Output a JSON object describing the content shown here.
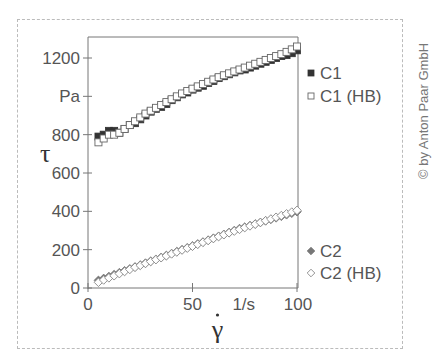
{
  "chart_data": {
    "type": "scatter",
    "title": "",
    "xlabel": "γ̇",
    "xunit": "1/s",
    "ylabel": "τ",
    "yunit": "Pa",
    "xlim": [
      0,
      100
    ],
    "ylim": [
      0,
      1300
    ],
    "x_ticks": [
      0,
      50,
      100
    ],
    "y_ticks": [
      0,
      200,
      400,
      600,
      800,
      1000,
      1200
    ],
    "y_tick_labels": [
      "0",
      "200",
      "400",
      "600",
      "800",
      "Pa",
      "1200"
    ],
    "x_tick_labels": [
      "0",
      "50",
      "1/s",
      "100"
    ],
    "grid": false,
    "legend_position": "right",
    "x": [
      5,
      7.5,
      10,
      12.5,
      15,
      17.5,
      20,
      22.5,
      25,
      27.5,
      30,
      32.5,
      35,
      37.5,
      40,
      42.5,
      45,
      47.5,
      50,
      52.5,
      55,
      57.5,
      60,
      62.5,
      65,
      67.5,
      70,
      72.5,
      75,
      77.5,
      80,
      82.5,
      85,
      87.5,
      90,
      92.5,
      95,
      97.5,
      100
    ],
    "series": [
      {
        "name": "C1",
        "marker": "filled-square",
        "color": "#333333",
        "values": [
          790,
          800,
          820,
          820,
          810,
          830,
          850,
          860,
          880,
          900,
          920,
          935,
          945,
          960,
          980,
          995,
          1010,
          1020,
          1035,
          1045,
          1055,
          1070,
          1080,
          1095,
          1105,
          1115,
          1125,
          1135,
          1140,
          1150,
          1160,
          1170,
          1180,
          1190,
          1200,
          1210,
          1215,
          1225,
          1240
        ]
      },
      {
        "name": "C1 (HB)",
        "marker": "open-square",
        "color": "#555555",
        "values": [
          760,
          780,
          800,
          800,
          810,
          830,
          850,
          870,
          890,
          910,
          925,
          940,
          955,
          970,
          985,
          1000,
          1015,
          1028,
          1040,
          1052,
          1064,
          1076,
          1088,
          1100,
          1110,
          1120,
          1130,
          1140,
          1150,
          1160,
          1170,
          1180,
          1190,
          1200,
          1210,
          1220,
          1232,
          1245,
          1260
        ]
      },
      {
        "name": "C2",
        "marker": "filled-diamond",
        "color": "#777777",
        "values": [
          40,
          50,
          60,
          70,
          80,
          90,
          100,
          110,
          120,
          130,
          140,
          150,
          160,
          170,
          180,
          190,
          200,
          210,
          220,
          230,
          240,
          250,
          260,
          270,
          280,
          290,
          300,
          310,
          318,
          326,
          334,
          342,
          350,
          358,
          366,
          374,
          382,
          390,
          398
        ]
      },
      {
        "name": "C2 (HB)",
        "marker": "open-diamond",
        "color": "#888888",
        "values": [
          30,
          42,
          53,
          64,
          75,
          86,
          97,
          108,
          118,
          128,
          138,
          148,
          158,
          168,
          178,
          188,
          198,
          208,
          218,
          228,
          238,
          248,
          258,
          268,
          278,
          288,
          297,
          306,
          315,
          324,
          333,
          342,
          351,
          360,
          369,
          378,
          387,
          396,
          405
        ]
      }
    ]
  },
  "legend": {
    "items": [
      {
        "label": "C1",
        "marker": "filled-square"
      },
      {
        "label": "C1 (HB)",
        "marker": "open-square"
      },
      {
        "label": "C2",
        "marker": "filled-diamond"
      },
      {
        "label": "C2 (HB)",
        "marker": "open-diamond"
      }
    ]
  },
  "copyright": "© by Anton Paar GmbH"
}
